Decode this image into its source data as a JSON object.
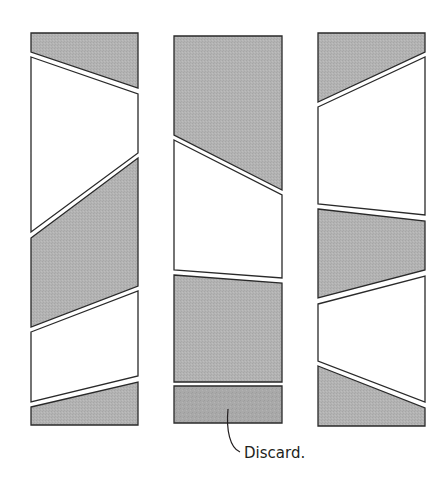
{
  "diagram": {
    "type": "strip-cutting-layout",
    "colors": {
      "shaded_fill": "#b0b0b0",
      "discard_fill": "#a8a8a8",
      "white_fill": "#ffffff",
      "stroke": "#2a2a2a"
    },
    "columns": [
      {
        "id": "strip-1",
        "pieces": [
          {
            "fill": "shaded",
            "points": "31,33 138,33 138,88 31,52"
          },
          {
            "fill": "white",
            "points": "31,57 138,94 138,153 31,232"
          },
          {
            "fill": "shaded",
            "points": "31,238 138,158 138,286 31,327"
          },
          {
            "fill": "white",
            "points": "31,332 138,291 138,376 31,402"
          },
          {
            "fill": "shaded",
            "points": "31,407 138,382 138,425 31,425"
          }
        ]
      },
      {
        "id": "strip-2",
        "pieces": [
          {
            "fill": "shaded",
            "points": "174,36 282,36 282,190 174,135"
          },
          {
            "fill": "white",
            "points": "174,140 282,195 282,278 174,270"
          },
          {
            "fill": "shaded",
            "points": "174,275 282,283 282,382 174,382"
          },
          {
            "fill": "discard",
            "points": "174,386 282,386 282,423 174,423"
          }
        ]
      },
      {
        "id": "strip-3",
        "pieces": [
          {
            "fill": "shaded",
            "points": "318,33 425,33 425,52 318,102"
          },
          {
            "fill": "white",
            "points": "318,107 425,57 425,215 318,204"
          },
          {
            "fill": "shaded",
            "points": "318,209 425,221 425,270 318,298"
          },
          {
            "fill": "white",
            "points": "318,304 425,276 425,402 318,361"
          },
          {
            "fill": "shaded",
            "points": "318,366 425,408 425,426 318,426"
          }
        ]
      }
    ],
    "callout": {
      "text": "Discard.",
      "leader_path": "M 228 409 C 226 430, 230 448, 240 452",
      "text_x": 244,
      "text_y": 458
    }
  }
}
